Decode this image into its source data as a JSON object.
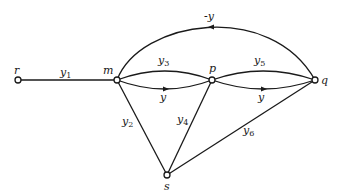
{
  "diagram": {
    "type": "signal-flow-graph",
    "nodes": {
      "r": {
        "label": "r"
      },
      "m": {
        "label": "m"
      },
      "p": {
        "label": "p"
      },
      "q": {
        "label": "q"
      },
      "s": {
        "label": "s"
      }
    },
    "edges": {
      "y1": {
        "from": "r",
        "to": "m",
        "base": "y",
        "sub": "1"
      },
      "y3": {
        "from": "m",
        "to": "p",
        "base": "y",
        "sub": "3"
      },
      "y_mp": {
        "from": "m",
        "to": "p",
        "base": "y",
        "sub": ""
      },
      "y5": {
        "from": "p",
        "to": "q",
        "base": "y",
        "sub": "5"
      },
      "y_pq": {
        "from": "p",
        "to": "q",
        "base": "y",
        "sub": ""
      },
      "neg_y": {
        "from": "q",
        "to": "m",
        "base": "-y",
        "sub": ""
      },
      "y2": {
        "from": "m",
        "to": "s",
        "base": "y",
        "sub": "2"
      },
      "y4": {
        "from": "p",
        "to": "s",
        "base": "y",
        "sub": "4"
      },
      "y6": {
        "from": "q",
        "to": "s",
        "base": "y",
        "sub": "6"
      }
    }
  }
}
